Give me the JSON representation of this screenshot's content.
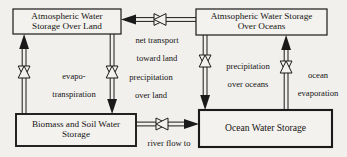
{
  "diagram": {
    "background_color": "#f2f0ec",
    "line_color": "#1a1a1a",
    "box_fill": "#f4f2ee",
    "stocks": [
      {
        "id": "atmospheric-water-storage-over-land",
        "label": "Atmospheric Water\nStorage Over Land",
        "line1": "Atmospheric Water",
        "line2": "Storage Over Land",
        "x": 13,
        "y": 9,
        "w": 108,
        "h": 25,
        "border_width": 1.2
      },
      {
        "id": "atmospheric-water-storage-over-oceans",
        "label": "Atmsopheric Water Storage\nOver Oceans",
        "line1": "Atmsopheric Water Storage",
        "line2": "Over Oceans",
        "x": 196,
        "y": 9,
        "w": 131,
        "h": 26,
        "border_width": 1.2
      },
      {
        "id": "biomass-and-soil-water-storage",
        "label": "Biomass and Soil Water\nStorage",
        "line1": "Biomass and Soil Water",
        "line2": "Storage",
        "x": 16,
        "y": 114,
        "w": 120,
        "h": 32,
        "border_width": 1.8
      },
      {
        "id": "ocean-water-storage",
        "label": "Ocean Water Storage",
        "line1": "Ocean Water Storage",
        "line2": "",
        "x": 199,
        "y": 110,
        "w": 133,
        "h": 37,
        "border_width": 2.0
      }
    ],
    "flows": [
      {
        "id": "net-transport-toward-land",
        "label": "net transport\ntoward land",
        "line1": "net transport",
        "line2": "toward land",
        "direction": "left",
        "label_x": 118,
        "label_y": 28,
        "label_w": 78
      },
      {
        "id": "evapotranspiration",
        "label": "evapo-\ntranspiration",
        "line1": "evapo-",
        "line2": "transpiration",
        "direction": "up",
        "label_x": 38,
        "label_y": 62,
        "label_w": 72
      },
      {
        "id": "precipitation-over-land",
        "label": "precipitation\nover land",
        "line1": "precipitation",
        "line2": "over land",
        "direction": "down",
        "label_x": 118,
        "label_y": 67,
        "label_w": 68
      },
      {
        "id": "precipitation-over-oceans",
        "label": "precipitation\nover oceans",
        "line1": "precipitation",
        "line2": "over oceans",
        "direction": "down",
        "label_x": 213,
        "label_y": 56,
        "label_w": 72
      },
      {
        "id": "ocean-evaporation",
        "label": "ocean\nevaporation",
        "line1": "ocean",
        "line2": "evaporation",
        "direction": "up",
        "label_x": 290,
        "label_y": 63,
        "label_w": 56
      },
      {
        "id": "river-flow-to-oceans",
        "label": "river flow to\noceans",
        "line1": "river flow to",
        "line2": "oceans",
        "direction": "right",
        "label_x": 142,
        "label_y": 130,
        "label_w": 68
      }
    ],
    "valve_icon": "bowtie-valve-icon"
  }
}
